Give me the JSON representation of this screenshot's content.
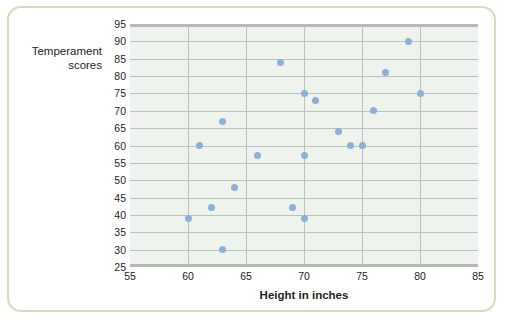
{
  "figure": {
    "border_color": "#cfe0bd",
    "plot_background": "#eef3ed",
    "grid_color": "#b9c3bd",
    "marker_color": "#8fb0d6"
  },
  "chart_data": {
    "type": "scatter",
    "title": "",
    "xlabel": "Height in inches",
    "ylabel": "Temperament scores",
    "ylabel_lines": [
      "Temperament",
      "scores"
    ],
    "xlim": [
      55,
      85
    ],
    "ylim": [
      25,
      95
    ],
    "xticks": [
      55,
      60,
      65,
      70,
      75,
      80,
      85
    ],
    "yticks": [
      25,
      30,
      35,
      40,
      45,
      50,
      55,
      60,
      65,
      70,
      75,
      80,
      85,
      90,
      95
    ],
    "grid": "horizontal-and-vertical",
    "legend": "none",
    "points": [
      {
        "x": 60,
        "y": 39
      },
      {
        "x": 61,
        "y": 60
      },
      {
        "x": 62,
        "y": 42
      },
      {
        "x": 63,
        "y": 30
      },
      {
        "x": 63,
        "y": 67
      },
      {
        "x": 64,
        "y": 48
      },
      {
        "x": 66,
        "y": 57
      },
      {
        "x": 68,
        "y": 84
      },
      {
        "x": 69,
        "y": 42
      },
      {
        "x": 70,
        "y": 39
      },
      {
        "x": 70,
        "y": 75
      },
      {
        "x": 70,
        "y": 57
      },
      {
        "x": 71,
        "y": 73
      },
      {
        "x": 73,
        "y": 64
      },
      {
        "x": 74,
        "y": 60
      },
      {
        "x": 75,
        "y": 60
      },
      {
        "x": 76,
        "y": 70
      },
      {
        "x": 77,
        "y": 81
      },
      {
        "x": 79,
        "y": 90
      },
      {
        "x": 80,
        "y": 75
      }
    ]
  }
}
